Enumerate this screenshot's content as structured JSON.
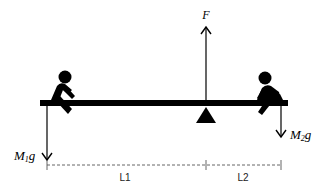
{
  "diagram": {
    "type": "seesaw-free-body-diagram",
    "colors": {
      "ink": "#000000",
      "dashed": "#555555",
      "background": "#ffffff"
    },
    "force_up": {
      "label": "F"
    },
    "force_left": {
      "symbol": "M",
      "subscript": "1",
      "suffix": "g"
    },
    "force_right": {
      "symbol": "M",
      "subscript": "2",
      "suffix": "g"
    },
    "distances": [
      {
        "label": "L1"
      },
      {
        "label": "L2"
      }
    ],
    "figures": [
      {
        "side": "left",
        "name": "person-1"
      },
      {
        "side": "right",
        "name": "person-2"
      }
    ]
  }
}
